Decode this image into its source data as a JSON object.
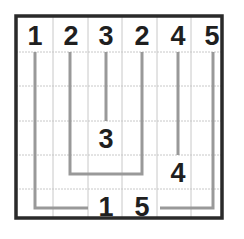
{
  "puzzle": {
    "rows": 6,
    "cols": 6,
    "frame": {
      "x": 16,
      "y": 16,
      "width": 206,
      "height": 202
    },
    "col_lines_x": [
      53,
      88,
      122,
      157,
      191
    ],
    "row_lines_y": [
      52,
      86,
      121,
      155,
      189
    ],
    "colors": {
      "frame": "#2a2a2a",
      "grid": "#c8c8c8",
      "path": "#999999",
      "number": "#1f1f1f",
      "background": "#ffffff"
    },
    "numbers": [
      {
        "row": 0,
        "col": 0,
        "value": "1",
        "x": 35,
        "y": 35
      },
      {
        "row": 0,
        "col": 1,
        "value": "2",
        "x": 71,
        "y": 35
      },
      {
        "row": 0,
        "col": 2,
        "value": "3",
        "x": 106,
        "y": 35
      },
      {
        "row": 0,
        "col": 3,
        "value": "2",
        "x": 142,
        "y": 35
      },
      {
        "row": 0,
        "col": 4,
        "value": "4",
        "x": 178,
        "y": 35
      },
      {
        "row": 0,
        "col": 5,
        "value": "5",
        "x": 212,
        "y": 35
      },
      {
        "row": 3,
        "col": 2,
        "value": "3",
        "x": 106,
        "y": 138
      },
      {
        "row": 4,
        "col": 4,
        "value": "4",
        "x": 178,
        "y": 172
      },
      {
        "row": 5,
        "col": 2,
        "value": "1",
        "x": 106,
        "y": 206
      },
      {
        "row": 5,
        "col": 3,
        "value": "5",
        "x": 142,
        "y": 206
      }
    ],
    "paths": [
      {
        "id": "path-1",
        "points": "35,52 35,208 88,208"
      },
      {
        "id": "path-2",
        "points": "70,52 70,174 142,174 142,52"
      },
      {
        "id": "path-3",
        "points": "106,52 106,121"
      },
      {
        "id": "path-4",
        "points": "178,52 178,155"
      },
      {
        "id": "path-5",
        "points": "213,52 213,208 160,208"
      }
    ]
  }
}
